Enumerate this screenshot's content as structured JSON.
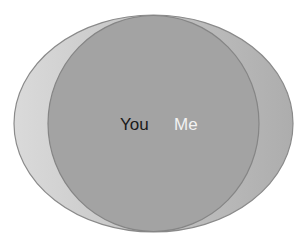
{
  "diagram": {
    "type": "euler",
    "sets": [
      {
        "id": "you",
        "label": "You",
        "shape": "ellipse",
        "cx": 153.5,
        "cy": 123.5,
        "rx": 139.5,
        "ry": 108.5,
        "fill_left": "#dadada",
        "fill_right": "#adadad",
        "stroke": "#8a8a8a",
        "label_color": "#1a1a1a"
      },
      {
        "id": "me",
        "label": "Me",
        "shape": "ellipse",
        "cx": 153.5,
        "cy": 123.5,
        "rx": 105.5,
        "ry": 108,
        "fill": "#a3a3a3",
        "stroke": "#858585",
        "label_color": "#f2f2f2"
      }
    ],
    "relationship": "Me is contained within You"
  },
  "labels": {
    "you": "You",
    "me": "Me"
  }
}
